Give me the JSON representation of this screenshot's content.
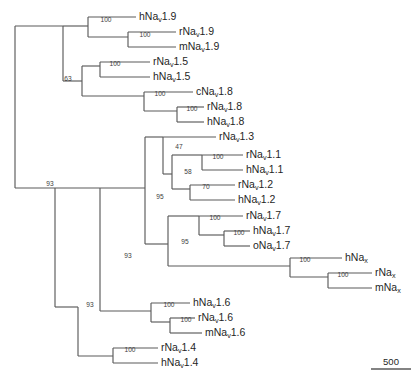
{
  "figure": {
    "kind": "phylogenetic-tree",
    "width": 419,
    "height": 384,
    "background_color": "#ffffff",
    "branch_color": "#5a5a5a",
    "text_color": "#1f1f1f"
  },
  "chart_data": {
    "type": "tree",
    "title": "",
    "xlabel": "",
    "ylabel": "",
    "orientation": "rectangular-left-to-right",
    "node_labels": "bootstrap support values (percent)",
    "scale_bar": {
      "label": "500",
      "units": "substitutions",
      "x_start": 371,
      "x_end": 411,
      "y": 369
    },
    "tips": [
      {
        "id": "hNav1.9",
        "prefix": "hNa",
        "sub": "v",
        "suffix": "1.9",
        "x": 139,
        "y": 17
      },
      {
        "id": "rNav1.9",
        "prefix": "rNa",
        "sub": "v",
        "suffix": "1.9",
        "x": 179,
        "y": 32
      },
      {
        "id": "mNav1.9",
        "prefix": "mNa",
        "sub": "v",
        "suffix": "1.9",
        "x": 179,
        "y": 47
      },
      {
        "id": "rNav1.5",
        "prefix": "rNa",
        "sub": "v",
        "suffix": "1.5",
        "x": 153,
        "y": 62
      },
      {
        "id": "hNav1.5",
        "prefix": "hNa",
        "sub": "v",
        "suffix": "1.5",
        "x": 153,
        "y": 77
      },
      {
        "id": "cNav1.8",
        "prefix": "cNa",
        "sub": "v",
        "suffix": "1.8",
        "x": 196,
        "y": 92
      },
      {
        "id": "rNav1.8",
        "prefix": "rNa",
        "sub": "v",
        "suffix": "1.8",
        "x": 207,
        "y": 107
      },
      {
        "id": "hNav1.8",
        "prefix": "hNa",
        "sub": "v",
        "suffix": "1.8",
        "x": 207,
        "y": 122
      },
      {
        "id": "rNav1.3",
        "prefix": "rNa",
        "sub": "v",
        "suffix": "1.3",
        "x": 219,
        "y": 137
      },
      {
        "id": "rNav1.1",
        "prefix": "rNa",
        "sub": "v",
        "suffix": "1.1",
        "x": 246,
        "y": 155
      },
      {
        "id": "hNav1.1",
        "prefix": "hNa",
        "sub": "v",
        "suffix": "1.1",
        "x": 246,
        "y": 170
      },
      {
        "id": "rNav1.2",
        "prefix": "rNa",
        "sub": "v",
        "suffix": "1.2",
        "x": 238,
        "y": 185
      },
      {
        "id": "hNav1.2",
        "prefix": "hNa",
        "sub": "v",
        "suffix": "1.2",
        "x": 238,
        "y": 200
      },
      {
        "id": "rNav1.7",
        "prefix": "rNa",
        "sub": "v",
        "suffix": "1.7",
        "x": 246,
        "y": 216
      },
      {
        "id": "hNav1.7",
        "prefix": "hNa",
        "sub": "v",
        "suffix": "1.7",
        "x": 253,
        "y": 231
      },
      {
        "id": "oNav1.7",
        "prefix": "oNa",
        "sub": "v",
        "suffix": "1.7",
        "x": 253,
        "y": 246
      },
      {
        "id": "hNax",
        "prefix": "hNa",
        "sub": "x",
        "suffix": "",
        "x": 345,
        "y": 258
      },
      {
        "id": "rNax",
        "prefix": "rNa",
        "sub": "x",
        "suffix": "",
        "x": 375,
        "y": 273
      },
      {
        "id": "mNax",
        "prefix": "mNa",
        "sub": "x",
        "suffix": "",
        "x": 375,
        "y": 288
      },
      {
        "id": "hNav1.6",
        "prefix": "hNa",
        "sub": "v",
        "suffix": "1.6",
        "x": 193,
        "y": 303
      },
      {
        "id": "rNav1.6",
        "prefix": "rNa",
        "sub": "v",
        "suffix": "1.6",
        "x": 198,
        "y": 318
      },
      {
        "id": "mNav1.6",
        "prefix": "mNa",
        "sub": "v",
        "suffix": "1.6",
        "x": 205,
        "y": 333
      },
      {
        "id": "rNav1.4",
        "prefix": "rNa",
        "sub": "v",
        "suffix": "1.4",
        "x": 161,
        "y": 348
      },
      {
        "id": "hNav1.4",
        "prefix": "hNa",
        "sub": "v",
        "suffix": "1.4",
        "x": 161,
        "y": 363
      }
    ],
    "support_values": [
      {
        "value": "100",
        "x": 106,
        "y": 22,
        "node": "Nav1.9-clade"
      },
      {
        "value": "100",
        "x": 145,
        "y": 37,
        "node": "rNav1.9-mNav1.9"
      },
      {
        "value": "100",
        "x": 115,
        "y": 66,
        "node": "Nav1.5-clade"
      },
      {
        "value": "63",
        "x": 68,
        "y": 81,
        "node": "Nav1.5-Nav1.8-ancestor"
      },
      {
        "value": "100",
        "x": 160,
        "y": 96,
        "node": "Nav1.8-clade"
      },
      {
        "value": "100",
        "x": 192,
        "y": 111,
        "node": "rNav1.8-hNav1.8"
      },
      {
        "value": "47",
        "x": 179,
        "y": 149,
        "node": "Nav1.3-Nav1.1-Nav1.2"
      },
      {
        "value": "100",
        "x": 218,
        "y": 159,
        "node": "Nav1.1-clade"
      },
      {
        "value": "58",
        "x": 188,
        "y": 174,
        "node": "Nav1.1-Nav1.2-ancestor"
      },
      {
        "value": "70",
        "x": 206,
        "y": 189,
        "node": "Nav1.2-clade"
      },
      {
        "value": "95",
        "x": 160,
        "y": 199,
        "node": "Nav1.3-1.1-1.2-1.7-Nax"
      },
      {
        "value": "100",
        "x": 215,
        "y": 220,
        "node": "Nav1.7-clade"
      },
      {
        "value": "100",
        "x": 239,
        "y": 235,
        "node": "hNav1.7-oNav1.7"
      },
      {
        "value": "95",
        "x": 185,
        "y": 244,
        "node": "Nav1.7-clade-ancestor"
      },
      {
        "value": "100",
        "x": 305,
        "y": 262,
        "node": "Nax-clade"
      },
      {
        "value": "100",
        "x": 343,
        "y": 277,
        "node": "rNax-mNax"
      },
      {
        "value": "93",
        "x": 128,
        "y": 258,
        "node": "upper-major-clade"
      },
      {
        "value": "100",
        "x": 169,
        "y": 307,
        "node": "Nav1.6-clade"
      },
      {
        "value": "100",
        "x": 186,
        "y": 322,
        "node": "rNav1.6-mNav1.6"
      },
      {
        "value": "93",
        "x": 90,
        "y": 307,
        "node": "Nav1.6-plus-ancestor"
      },
      {
        "value": "100",
        "x": 130,
        "y": 352,
        "node": "Nav1.4-clade"
      },
      {
        "value": "93",
        "x": 50,
        "y": 186,
        "node": "root-node"
      }
    ],
    "branches": [
      {
        "d": "M 15 26 L 15 188",
        "name": "root-spine"
      },
      {
        "d": "M 15 26 L 63 26",
        "name": "root-to-upper"
      },
      {
        "d": "M 15 188 L 55 188",
        "name": "root-to-lower"
      },
      {
        "d": "M 63 26 L 63 81",
        "name": "node-upper-spine"
      },
      {
        "d": "M 63 26 L 88 26",
        "name": "to-Nav19-clade"
      },
      {
        "d": "M 88 17 L 88 37",
        "name": "Nav19-spine"
      },
      {
        "d": "M 88 17 L 136 17",
        "name": "tip-hNav19"
      },
      {
        "d": "M 88 37 L 128 37",
        "name": "Nav19-to-rm"
      },
      {
        "d": "M 128 32 L 128 47",
        "name": "rm-Nav19-spine"
      },
      {
        "d": "M 128 32 L 176 32",
        "name": "tip-rNav19"
      },
      {
        "d": "M 128 47 L 176 47",
        "name": "tip-mNav19"
      },
      {
        "d": "M 63 81 L 82 81",
        "name": "to-Nav15-Nav18"
      },
      {
        "d": "M 82 66 L 82 96",
        "name": "Nav15-Nav18-spine"
      },
      {
        "d": "M 82 66 L 100 66",
        "name": "to-Nav15-clade"
      },
      {
        "d": "M 100 62 L 100 77",
        "name": "Nav15-spine"
      },
      {
        "d": "M 100 62 L 150 62",
        "name": "tip-rNav15"
      },
      {
        "d": "M 100 77 L 150 77",
        "name": "tip-hNav15"
      },
      {
        "d": "M 82 96 L 144 96",
        "name": "to-Nav18-clade"
      },
      {
        "d": "M 144 92 L 144 111",
        "name": "Nav18-spine"
      },
      {
        "d": "M 144 92 L 193 92",
        "name": "tip-cNav18"
      },
      {
        "d": "M 144 111 L 177 111",
        "name": "Nav18-to-rh"
      },
      {
        "d": "M 177 107 L 177 122",
        "name": "rh-Nav18-spine"
      },
      {
        "d": "M 177 107 L 204 107",
        "name": "tip-rNav18"
      },
      {
        "d": "M 177 122 L 204 122",
        "name": "tip-hNav18"
      },
      {
        "d": "M 55 188 L 55 307",
        "name": "lower-spine"
      },
      {
        "d": "M 55 307 L 78 307",
        "name": "to-Nav16-group"
      },
      {
        "d": "M 55 188 L 100 188",
        "name": "to-upper-major"
      },
      {
        "d": "M 100 188 L 100 258",
        "name": "upper-major-spine-a"
      },
      {
        "d": "M 100 258 L 100 258",
        "name": "noop"
      },
      {
        "d": "M 100 188 L 145 188",
        "name": "to-95-node"
      },
      {
        "d": "M 145 137 L 145 244",
        "name": "node95-spine"
      },
      {
        "d": "M 145 137 L 163 137",
        "name": "to-47-node"
      },
      {
        "d": "M 163 137 L 163 174",
        "name": "node47-spine"
      },
      {
        "d": "M 163 137 L 216 137",
        "name": "tip-rNav13"
      },
      {
        "d": "M 163 174 L 172 174",
        "name": "node47-to-58"
      },
      {
        "d": "M 172 155 L 172 189",
        "name": "node58-spine"
      },
      {
        "d": "M 172 155 L 202 155",
        "name": "to-Nav11-clade"
      },
      {
        "d": "M 202 155 L 202 170",
        "name": "Nav11-spine"
      },
      {
        "d": "M 202 155 L 243 155",
        "name": "tip-rNav11"
      },
      {
        "d": "M 202 170 L 243 170",
        "name": "tip-hNav11"
      },
      {
        "d": "M 172 189 L 190 189",
        "name": "to-Nav12-clade"
      },
      {
        "d": "M 190 185 L 190 200",
        "name": "Nav12-spine"
      },
      {
        "d": "M 190 185 L 235 185",
        "name": "tip-rNav12"
      },
      {
        "d": "M 190 200 L 235 200",
        "name": "tip-hNav12"
      },
      {
        "d": "M 145 244 L 168 244",
        "name": "to-Nav17-Nax"
      },
      {
        "d": "M 168 216 L 168 266",
        "name": "Nav17-Nax-spine"
      },
      {
        "d": "M 168 216 L 199 216",
        "name": "to-Nav17-clade"
      },
      {
        "d": "M 199 216 L 199 235",
        "name": "Nav17-spine"
      },
      {
        "d": "M 199 216 L 243 216",
        "name": "tip-rNav17"
      },
      {
        "d": "M 199 235 L 224 235",
        "name": "Nav17-to-ho"
      },
      {
        "d": "M 224 231 L 224 246",
        "name": "ho-Nav17-spine"
      },
      {
        "d": "M 224 231 L 250 231",
        "name": "tip-hNav17"
      },
      {
        "d": "M 224 246 L 250 246",
        "name": "tip-oNav17"
      },
      {
        "d": "M 168 266 L 290 266",
        "name": "to-Nax-clade"
      },
      {
        "d": "M 290 258 L 290 277",
        "name": "Nax-spine"
      },
      {
        "d": "M 290 258 L 342 258",
        "name": "tip-hNax"
      },
      {
        "d": "M 290 277 L 328 277",
        "name": "Nax-to-rm"
      },
      {
        "d": "M 328 273 L 328 288",
        "name": "rm-Nax-spine"
      },
      {
        "d": "M 328 273 L 372 273",
        "name": "tip-rNax"
      },
      {
        "d": "M 328 288 L 372 288",
        "name": "tip-mNax"
      },
      {
        "d": "M 100 258 L 100 311",
        "name": "upper-major-spine-b"
      },
      {
        "d": "M 100 311 L 151 311",
        "name": "to-Nav16-clade"
      },
      {
        "d": "M 151 303 L 151 322",
        "name": "Nav16-spine"
      },
      {
        "d": "M 151 303 L 190 303",
        "name": "tip-hNav16"
      },
      {
        "d": "M 151 322 L 170 322",
        "name": "Nav16-to-rm"
      },
      {
        "d": "M 170 318 L 170 333",
        "name": "rm-Nav16-spine"
      },
      {
        "d": "M 170 318 L 195 318",
        "name": "tip-rNav16"
      },
      {
        "d": "M 170 333 L 202 333",
        "name": "tip-mNav16"
      },
      {
        "d": "M 78 307 L 78 356",
        "name": "node93b-spine"
      },
      {
        "d": "M 78 356 L 113 356",
        "name": "to-Nav14-clade"
      },
      {
        "d": "M 113 348 L 113 363",
        "name": "Nav14-spine"
      },
      {
        "d": "M 113 348 L 158 348",
        "name": "tip-rNav14"
      },
      {
        "d": "M 113 363 L 158 363",
        "name": "tip-hNav14"
      }
    ]
  }
}
